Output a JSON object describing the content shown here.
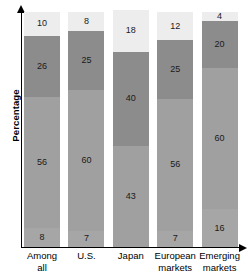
{
  "chart_data": {
    "type": "bar",
    "subtype": "stacked-bar-100",
    "title": "",
    "subtitle": "",
    "xlabel": "",
    "ylabel": "Percentage",
    "ylim": [
      0,
      100
    ],
    "grid": false,
    "legend": "none",
    "categories": [
      "Among all",
      "U.S.",
      "Japan",
      "European markets",
      "Emerging markets"
    ],
    "category_lines": [
      [
        "Among",
        "all"
      ],
      [
        "U.S."
      ],
      [
        "Japan"
      ],
      [
        "European",
        "markets"
      ],
      [
        "Emerging",
        "markets"
      ]
    ],
    "stack_order": "bottom-to-top",
    "series": [
      {
        "name": "segment-1",
        "color": "#a6a6a6",
        "values": [
          8,
          7,
          43,
          7,
          16
        ]
      },
      {
        "name": "segment-2",
        "color": "#a0a0a0",
        "values": [
          56,
          60,
          40,
          56,
          60
        ]
      },
      {
        "name": "segment-3",
        "color": "#8c8c8c",
        "values": [
          26,
          25,
          18,
          25,
          20
        ]
      },
      {
        "name": "segment-4",
        "color": "#ededed",
        "values": [
          10,
          8,
          0,
          12,
          4
        ]
      }
    ],
    "bars": [
      {
        "category": "Among all",
        "segments": [
          {
            "value": 10,
            "label": "10",
            "color": "#ededed"
          },
          {
            "value": 26,
            "label": "26",
            "color": "#8c8c8c"
          },
          {
            "value": 56,
            "label": "56",
            "color": "#a0a0a0"
          },
          {
            "value": 8,
            "label": "8",
            "color": "#a6a6a6"
          }
        ]
      },
      {
        "category": "U.S.",
        "segments": [
          {
            "value": 8,
            "label": "8",
            "color": "#ededed"
          },
          {
            "value": 25,
            "label": "25",
            "color": "#8c8c8c"
          },
          {
            "value": 60,
            "label": "60",
            "color": "#a0a0a0"
          },
          {
            "value": 7,
            "label": "7",
            "color": "#a6a6a6"
          }
        ]
      },
      {
        "category": "Japan",
        "segments": [
          {
            "value": 18,
            "label": "18",
            "color": "#ededed"
          },
          {
            "value": 40,
            "label": "40",
            "color": "#8c8c8c"
          },
          {
            "value": 43,
            "label": "43",
            "color": "#a0a0a0"
          }
        ]
      },
      {
        "category": "European markets",
        "segments": [
          {
            "value": 12,
            "label": "12",
            "color": "#ededed"
          },
          {
            "value": 25,
            "label": "25",
            "color": "#8c8c8c"
          },
          {
            "value": 56,
            "label": "56",
            "color": "#a0a0a0"
          },
          {
            "value": 7,
            "label": "7",
            "color": "#a6a6a6"
          }
        ]
      },
      {
        "category": "Emerging markets",
        "segments": [
          {
            "value": 4,
            "label": "4",
            "color": "#ededed"
          },
          {
            "value": 20,
            "label": "20",
            "color": "#8c8c8c"
          },
          {
            "value": 60,
            "label": "60",
            "color": "#a0a0a0"
          },
          {
            "value": 16,
            "label": "16",
            "color": "#a6a6a6"
          }
        ]
      }
    ],
    "axis_style": {
      "y_axis_arrow": true,
      "x_axis_arrow": true,
      "axis_color": "#000000"
    }
  }
}
